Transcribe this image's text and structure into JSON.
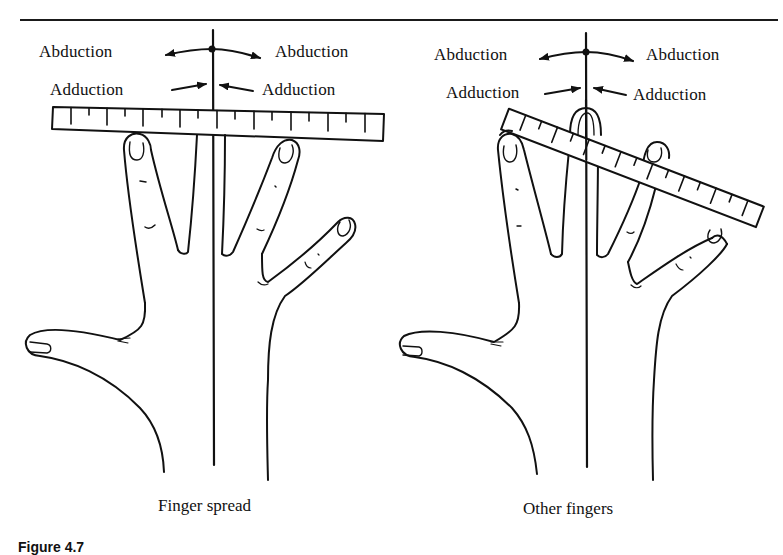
{
  "figure": {
    "caption_number": "Figure 4.7",
    "caption_text": "Range of motion and finger spread measured with a ruler (partially visible)"
  },
  "panels": [
    {
      "id": "left",
      "sub_caption": "Finger spread",
      "labels": {
        "abduction_left": "Abduction",
        "abduction_right": "Abduction",
        "adduction_left": "Adduction",
        "adduction_right": "Adduction"
      },
      "ruler": {
        "orientation": "horizontal",
        "tick_count": 18
      }
    },
    {
      "id": "right",
      "sub_caption": "Other fingers",
      "labels": {
        "abduction_left": "Abduction",
        "abduction_right": "Abduction",
        "adduction_left": "Adduction",
        "adduction_right": "Adduction"
      },
      "ruler": {
        "orientation": "tilted",
        "tilt_degrees": 21,
        "tick_count": 16
      }
    }
  ],
  "colors": {
    "ink": "#111111",
    "background": "#ffffff"
  }
}
